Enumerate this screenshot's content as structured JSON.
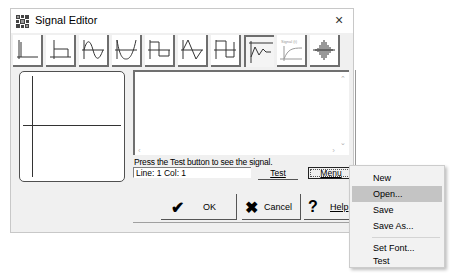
{
  "window": {
    "title": "Signal Editor",
    "close_glyph": "×"
  },
  "toolbar": {
    "tools": [
      {
        "name": "impulse",
        "active": false
      },
      {
        "name": "step",
        "active": false
      },
      {
        "name": "sine",
        "active": false
      },
      {
        "name": "rectified-sine",
        "active": false
      },
      {
        "name": "square",
        "active": false
      },
      {
        "name": "triangle",
        "active": false
      },
      {
        "name": "square-pulse",
        "active": false
      },
      {
        "name": "damped-response",
        "active": true
      },
      {
        "name": "signal-rise",
        "active": false,
        "label": "Signal (t)"
      },
      {
        "name": "noise-burst",
        "active": false
      }
    ]
  },
  "editor": {
    "hint": "Press the Test button to see the signal.",
    "status": "Line: 1   Col: 1",
    "test_label": "Test",
    "menu_label": "Menu"
  },
  "buttons": {
    "ok": "OK",
    "cancel": "Cancel",
    "help": "Help",
    "ok_icon": "✔",
    "cancel_icon": "✖",
    "help_icon": "?"
  },
  "menu": {
    "items": [
      {
        "label": "New",
        "highlighted": false
      },
      {
        "label": "Open...",
        "highlighted": true
      },
      {
        "label": "Save",
        "highlighted": false
      },
      {
        "label": "Save As...",
        "highlighted": false
      },
      {
        "label": "Set Font...",
        "highlighted": false
      },
      {
        "label": "Test",
        "highlighted": false
      }
    ]
  },
  "colors": {
    "dialog_bg": "#f0f0f0",
    "menu_highlight": "#c4c4c4"
  }
}
